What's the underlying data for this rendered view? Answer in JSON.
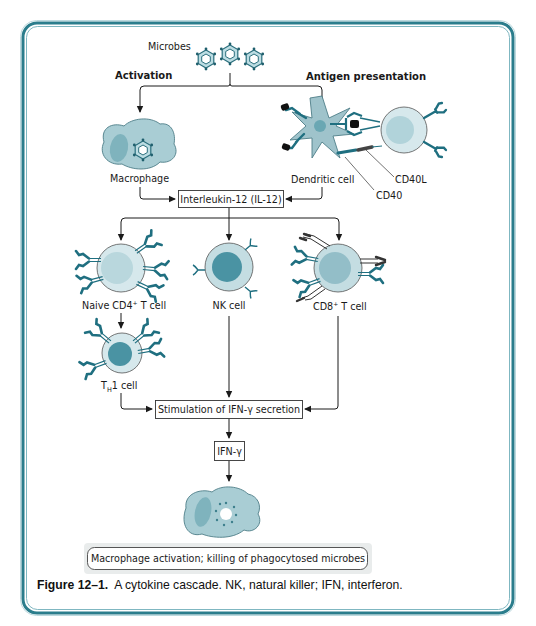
{
  "figure": {
    "title": "Figure 12–1.",
    "caption": "A cytokine cascade. NK, natural killer; IFN, interferon."
  },
  "labels": {
    "microbes": "Microbes",
    "activation": "Activation",
    "antigen_presentation": "Antigen presentation",
    "macrophage": "Macrophage",
    "dendritic_cell": "Dendritic cell",
    "cd40l": "CD40L",
    "cd40": "CD40",
    "naive_cd4_prefix": "Naive CD4",
    "naive_cd4_sup": "+",
    "naive_cd4_suffix": " T cell",
    "nk_cell": "NK cell",
    "cd8_prefix": "CD8",
    "cd8_sup": "+",
    "cd8_suffix": " T cell",
    "th1_T": "T",
    "th1_sub": "H",
    "th1_suffix": "1 cell"
  },
  "boxes": {
    "il12": "Interleukin-12 (IL-12)",
    "stimulation": "Stimulation of IFN-γ secretion",
    "ifn_gamma": "IFN-γ",
    "outcome": "Macrophage activation; killing of phagocytosed microbes"
  },
  "colors": {
    "frame": "#2b7d8c",
    "cell_fill": "#a9cdd4",
    "cell_light": "#d6e8ec",
    "nucleus": "#4a93a3",
    "receptor": "#1f6f80",
    "dark": "#2a2a2a"
  }
}
